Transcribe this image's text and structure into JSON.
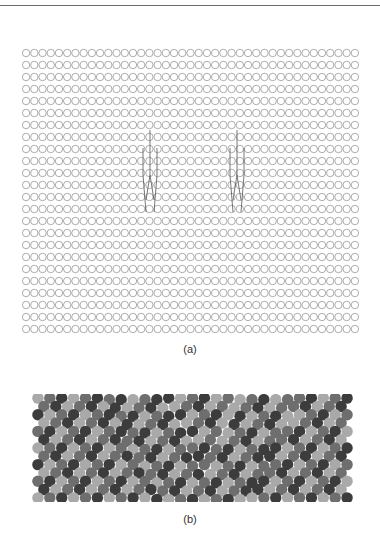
{
  "figure": {
    "panels": [
      {
        "id": "a",
        "label": "(a)",
        "description": "Square-ish lattice of open circles (rows of atoms) with two dislocation line markers",
        "rows": 24,
        "cols": 41,
        "circle_stroke": "#8a8a8a",
        "dislocations": [
          {
            "x": 150,
            "y_top": 130,
            "y_bottom": 212
          },
          {
            "x": 237,
            "y_top": 130,
            "y_bottom": 212
          }
        ]
      },
      {
        "id": "b",
        "label": "(b)",
        "description": "Close-packed atomic lattice in three gray shades showing two tilted grain-boundary bands",
        "rows": 13,
        "cols": 27,
        "colors": {
          "light": "#a9a9a9",
          "mid": "#6e6e6e",
          "dark": "#3c3c3c"
        }
      }
    ]
  }
}
